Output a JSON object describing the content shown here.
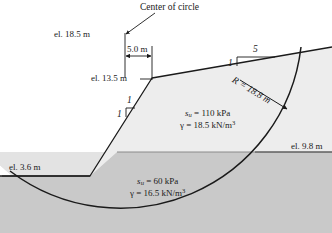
{
  "figure": {
    "type": "engineering-diagram"
  },
  "annotations": {
    "center_of_circle": "Center of circle",
    "elevation_top": "el. 18.5 m",
    "elevation_crest": "el. 13.5 m",
    "elevation_right": "el. 9.8 m",
    "elevation_toe": "el. 3.6 m",
    "dimension_horizontal": "5.0 m",
    "radius": "R = 18.8 m"
  },
  "slope_ratios": {
    "upper_vertical": "1",
    "upper_horizontal": "5",
    "face_vertical": "1",
    "face_horizontal": "1"
  },
  "soil_layers": [
    {
      "name": "upper-layer",
      "su_symbol": "s",
      "su_subscript": "u",
      "su_value": "= 110 kPa",
      "gamma_symbol": "γ",
      "gamma_value": "= 18.5 kN/m",
      "gamma_exponent": "3",
      "fill": "#e8e8e8"
    },
    {
      "name": "lower-layer",
      "su_symbol": "s",
      "su_subscript": "u",
      "su_value": "= 60 kPa",
      "gamma_symbol": "γ",
      "gamma_value": "= 16.5 kN/m",
      "gamma_exponent": "3",
      "fill": "#c9c9c9"
    }
  ],
  "colors": {
    "line": "#1a1a1a",
    "upper_fill": "#ededed",
    "lower_fill": "#c9c9c9",
    "halo_fill": "#dcdcdc",
    "text": "#1a1a1a"
  }
}
